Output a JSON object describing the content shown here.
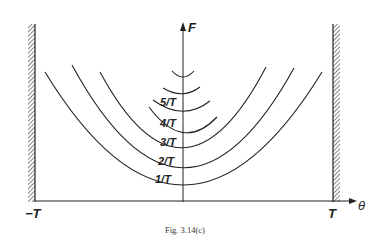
{
  "figure": {
    "caption": "Fig. 3.14(c)",
    "y_axis_label": "F",
    "x_axis_label": "θ",
    "x_left_label": "−T",
    "x_right_label": "T"
  },
  "curves": {
    "labels": [
      "1/T",
      "2/T",
      "3/T",
      "4/T",
      "5/T"
    ]
  },
  "colors": {
    "ink": "#222222",
    "background": "#ffffff"
  }
}
